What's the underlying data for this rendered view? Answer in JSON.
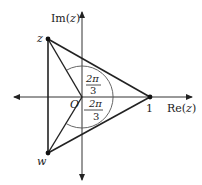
{
  "diagram": {
    "type": "complex-plane",
    "axes": {
      "real_label": "Re(z)",
      "imag_label": "Im(z)",
      "real_label_pre": "Re(",
      "real_label_var": "z",
      "real_label_post": ")",
      "imag_label_pre": "Im(",
      "imag_label_var": "z",
      "imag_label_post": ")"
    },
    "points": {
      "z": {
        "label": "z"
      },
      "w": {
        "label": "w"
      },
      "one": {
        "label": "1"
      },
      "origin": {
        "label": "O"
      }
    },
    "angles": {
      "upper": {
        "numerator": "2π",
        "denominator": "3"
      },
      "lower": {
        "numerator": "2π",
        "denominator": "3"
      }
    },
    "colors": {
      "stroke": "#222222",
      "arc": "#555555",
      "background": "#ffffff"
    }
  }
}
